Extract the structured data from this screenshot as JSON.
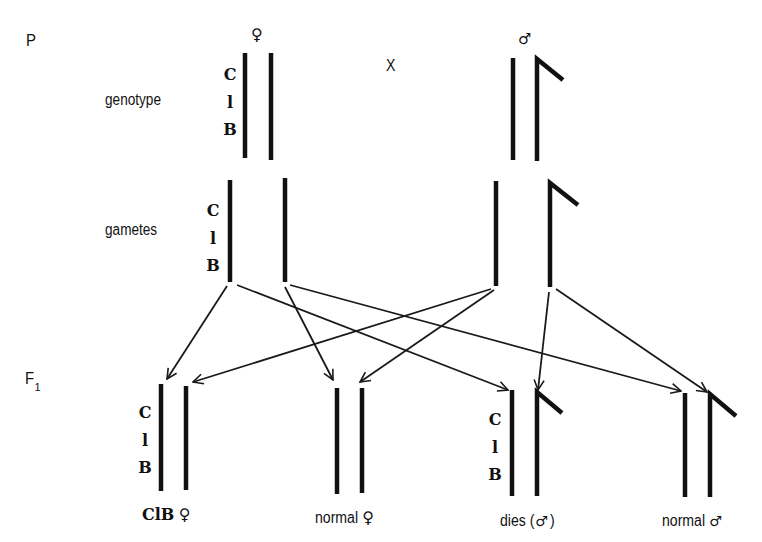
{
  "diagram": {
    "generations": {
      "parental": "P",
      "f1": "F",
      "f1_subscript": "1"
    },
    "row_labels": {
      "genotype": "genotype",
      "gametes": "gametes"
    },
    "cross_symbol": "X",
    "sex_symbols": {
      "female": "♀",
      "male": "♂"
    },
    "genes": [
      "C",
      "l",
      "B"
    ],
    "parents": [
      {
        "sex": "female",
        "symbol": "♀",
        "genotype": "ClB / +",
        "chromosomes": [
          "X (ClB)",
          "X"
        ]
      },
      {
        "sex": "male",
        "symbol": "♂",
        "genotype": "X / Y",
        "chromosomes": [
          "X",
          "Y"
        ]
      }
    ],
    "gametes": [
      {
        "id": "female-ClB",
        "parent": "female",
        "chromosome": "X (ClB)"
      },
      {
        "id": "female-normal",
        "parent": "female",
        "chromosome": "X"
      },
      {
        "id": "male-X",
        "parent": "male",
        "chromosome": "X"
      },
      {
        "id": "male-Y",
        "parent": "male",
        "chromosome": "Y"
      }
    ],
    "offspring": [
      {
        "label": "ClB ♀",
        "text": "ClB",
        "symbol": "♀",
        "from": [
          "female-ClB",
          "male-X"
        ]
      },
      {
        "label": "normal ♀",
        "text": "normal",
        "symbol": "♀",
        "from": [
          "female-normal",
          "male-X"
        ]
      },
      {
        "label": "dies (♂)",
        "text": "dies (",
        "symbol": "♂",
        "suffix": ")",
        "from": [
          "female-ClB",
          "male-Y"
        ]
      },
      {
        "label": "normal ♂",
        "text": "normal",
        "symbol": "♂",
        "from": [
          "female-normal",
          "male-Y"
        ]
      }
    ],
    "colors": {
      "ink": "#111111",
      "background": "#ffffff"
    }
  }
}
